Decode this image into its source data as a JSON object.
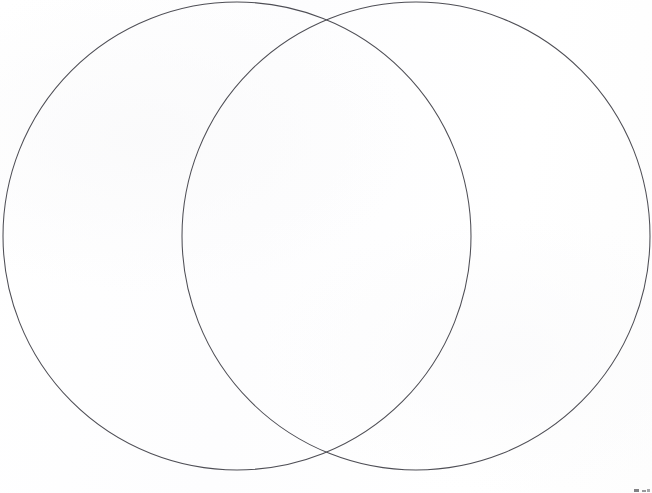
{
  "page": {
    "title": "Venn Diagram",
    "width": 652,
    "height": 493,
    "background_color": "#fefefe"
  },
  "chart_data": {
    "type": "diagram",
    "diagram_kind": "venn",
    "title": "",
    "subtitle": "",
    "xlabel": "",
    "ylabel": "",
    "grid": false,
    "legend": "none",
    "set_count": 2,
    "labels_shown": false,
    "fill": "none",
    "stroke_color": "#4e4e55",
    "stroke_width": 1,
    "sets": [
      {
        "name": "left-set",
        "label": "",
        "cx": 237,
        "cy": 236,
        "r": 234,
        "value": null
      },
      {
        "name": "right-set",
        "label": "",
        "cx": 416,
        "cy": 236,
        "r": 234,
        "value": null
      }
    ],
    "regions": [
      {
        "name": "left-only",
        "label": "",
        "value": null
      },
      {
        "name": "intersection",
        "label": "",
        "value": null
      },
      {
        "name": "right-only",
        "label": "",
        "value": null
      }
    ],
    "intersection_points": [
      {
        "x": 332,
        "y": 8
      },
      {
        "x": 332,
        "y": 455
      }
    ],
    "annotations": []
  },
  "artifacts": {
    "corner_smudge": {
      "name": "scan-artifact",
      "description": "",
      "color": "#3c3c42"
    }
  }
}
